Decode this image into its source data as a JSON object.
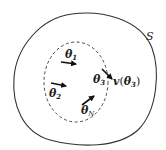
{
  "diagram": {
    "outer_region": {
      "label": "S",
      "stroke": "#333333"
    },
    "inner_region": {
      "style": "dashed",
      "stroke": "#444444"
    },
    "particles": [
      {
        "id": "theta1",
        "symbol": "θ",
        "subscript": "1"
      },
      {
        "id": "theta2",
        "symbol": "θ",
        "subscript": "2"
      },
      {
        "id": "theta3",
        "symbol": "θ",
        "subscript": "3"
      },
      {
        "id": "thetaN",
        "symbol": "θ",
        "subscript": "N"
      }
    ],
    "velocity_label": {
      "prefix": "v",
      "open": "(",
      "symbol": "θ",
      "subscript": "3",
      "close": ")"
    },
    "arrow_color": "#111111"
  }
}
